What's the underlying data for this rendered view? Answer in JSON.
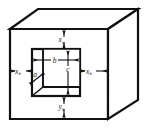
{
  "figure": {
    "type": "engineering-dimension-diagram",
    "line_color": "#111111",
    "background_color": "#ffffff",
    "labels": {
      "top_gap": {
        "base": "x",
        "sub": "a",
        "text": "xa",
        "position": "top",
        "description": "vertical gap from opening top edge to box top edge"
      },
      "left_gap": {
        "base": "x",
        "sub": "b",
        "text": "xb",
        "position": "left",
        "description": "horizontal gap from box left edge to opening left edge"
      },
      "right_gap": {
        "base": "x",
        "sub": "b",
        "text": "xb",
        "position": "right",
        "description": "horizontal gap from opening right edge to box right edge"
      },
      "bottom_gap": {
        "base": "y",
        "sub": "b",
        "text": "yb",
        "position": "bottom",
        "description": "vertical gap from opening bottom edge to box bottom edge"
      },
      "opening_width": {
        "base": "b",
        "sub": "",
        "text": "b",
        "position": "center-horizontal",
        "description": "width of rectangular opening"
      },
      "opening_height": {
        "base": "c",
        "sub": "",
        "text": "c",
        "position": "center-vertical",
        "description": "height of rectangular opening"
      },
      "depth": {
        "base": "a",
        "sub": "",
        "text": "a",
        "position": "interior-diagonal",
        "description": "depth of recess measured along the interior diagonal"
      }
    }
  }
}
